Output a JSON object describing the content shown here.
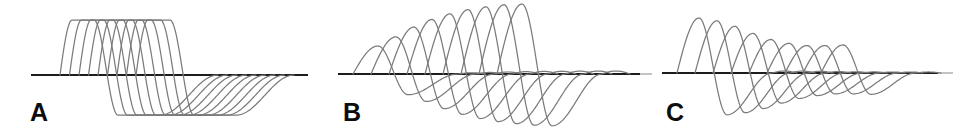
{
  "figure": {
    "background": "#ffffff",
    "trace_color": "#7b7b7b",
    "baseline_color": "#1c1c1c",
    "baseline_tip_color": "#b0b0b0",
    "label_color": "#0d0d0d",
    "panels": [
      {
        "label": "A",
        "label_pos": {
          "x": 30,
          "y": 100
        },
        "baseline": {
          "x1": 31,
          "x2": 308,
          "y": 75,
          "tip_x2": null
        },
        "wave": {
          "count": 9,
          "x0": 60,
          "dx": 9.5,
          "rise": 12,
          "flat_top": 22,
          "fall": 24,
          "flat_bottom": 42,
          "recovery": 58,
          "overshoot_px": 0,
          "overshoot_w": 0,
          "pos_amp": 55,
          "neg_ratio": 0.73,
          "amps": [
            1,
            1,
            1,
            1,
            1,
            1,
            1,
            1,
            1
          ]
        }
      },
      {
        "label": "B",
        "label_pos": {
          "x": 343,
          "y": 100
        },
        "baseline": {
          "x1": 338,
          "x2": 640,
          "y": 74,
          "tip_x2": 652
        },
        "wave": {
          "count": 9,
          "x0": 353,
          "dx": 18,
          "rise": 25,
          "flat_top": 0,
          "fall": 30,
          "flat_bottom": 0,
          "recovery": 50,
          "overshoot_px": 3,
          "overshoot_w": 28,
          "pos_amp": 70,
          "neg_ratio": 0.74,
          "amps": [
            0.4,
            0.53,
            0.67,
            0.78,
            0.86,
            0.92,
            0.96,
            0.99,
            1.0
          ]
        }
      },
      {
        "label": "C",
        "label_pos": {
          "x": 666,
          "y": 100
        },
        "baseline": {
          "x1": 662,
          "x2": 938,
          "y": 73,
          "tip_x2": 953
        },
        "wave": {
          "count": 9,
          "x0": 677,
          "dx": 18,
          "rise": 22,
          "flat_top": 0,
          "fall": 28,
          "flat_bottom": 0,
          "recovery": 45,
          "overshoot_px": 2,
          "overshoot_w": 25,
          "pos_amp": 55,
          "neg_ratio": 0.76,
          "amps": [
            1.0,
            0.95,
            0.85,
            0.72,
            0.61,
            0.54,
            0.5,
            0.5,
            0.51
          ]
        }
      }
    ]
  },
  "chart_data": {
    "type": "line",
    "title": "",
    "xlabel": "",
    "ylabel": "",
    "grid": false,
    "legend": false,
    "panels": [
      {
        "label": "A",
        "pattern": "constant amplitude, flat-topped (clipped) biphasic waves",
        "n_traces": 9,
        "relative_peak_amplitudes": [
          1,
          1,
          1,
          1,
          1,
          1,
          1,
          1,
          1
        ],
        "positive_peak_px": 55,
        "negative_trough_px": 40
      },
      {
        "label": "B",
        "pattern": "incrementing response: peak amplitude grows with each successive wave",
        "n_traces": 9,
        "relative_peak_amplitudes": [
          0.4,
          0.53,
          0.67,
          0.78,
          0.86,
          0.92,
          0.96,
          0.99,
          1.0
        ],
        "positive_peak_px": 70,
        "negative_trough_px": 52
      },
      {
        "label": "C",
        "pattern": "decrementing response: peak amplitude shrinks then plateaus with successive waves",
        "n_traces": 9,
        "relative_peak_amplitudes": [
          1.0,
          0.95,
          0.85,
          0.72,
          0.61,
          0.54,
          0.5,
          0.5,
          0.51
        ],
        "positive_peak_px": 55,
        "negative_trough_px": 42
      }
    ]
  }
}
